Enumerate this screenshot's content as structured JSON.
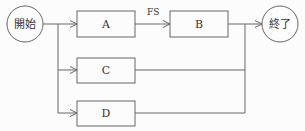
{
  "diagram": {
    "type": "activity-network",
    "nodes": {
      "start": {
        "label": "開始",
        "shape": "circle"
      },
      "end": {
        "label": "終了",
        "shape": "circle"
      },
      "a": {
        "label": "A",
        "shape": "rect"
      },
      "b": {
        "label": "B",
        "shape": "rect"
      },
      "c": {
        "label": "C",
        "shape": "rect"
      },
      "d": {
        "label": "D",
        "shape": "rect"
      }
    },
    "edges": [
      {
        "from": "開始",
        "to": "A"
      },
      {
        "from": "開始",
        "to": "C"
      },
      {
        "from": "開始",
        "to": "D"
      },
      {
        "from": "A",
        "to": "B",
        "label": "FS"
      },
      {
        "from": "B",
        "to": "終了"
      },
      {
        "from": "C",
        "to": "終了"
      },
      {
        "from": "D",
        "to": "終了"
      }
    ],
    "edge_label_fs": "FS",
    "colors": {
      "stroke": "#666666",
      "text": "#333333",
      "background": "#fcfcfc"
    }
  }
}
